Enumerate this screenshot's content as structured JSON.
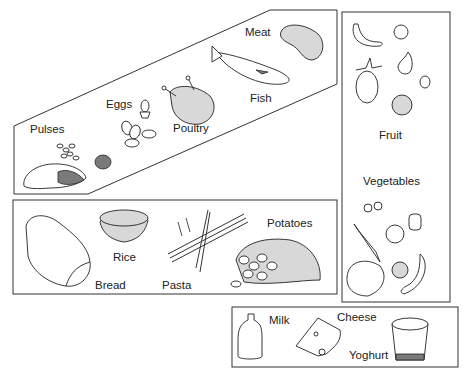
{
  "diagram": {
    "type": "food-groups",
    "groups": [
      {
        "id": "protein",
        "shape": "parallelogram",
        "items": [
          {
            "label": "Pulses"
          },
          {
            "label": "Eggs"
          },
          {
            "label": "Poultry"
          },
          {
            "label": "Fish"
          },
          {
            "label": "Meat"
          }
        ]
      },
      {
        "id": "fruit-veg",
        "shape": "tall-rectangle",
        "items": [
          {
            "label": "Fruit"
          },
          {
            "label": "Vegetables"
          }
        ]
      },
      {
        "id": "starch",
        "shape": "rectangle",
        "items": [
          {
            "label": "Rice"
          },
          {
            "label": "Potatoes"
          },
          {
            "label": "Bread"
          },
          {
            "label": "Pasta"
          }
        ]
      },
      {
        "id": "dairy",
        "shape": "rectangle",
        "items": [
          {
            "label": "Milk"
          },
          {
            "label": "Cheese"
          },
          {
            "label": "Yoghurt"
          }
        ]
      }
    ]
  },
  "colors": {
    "line": "#333333",
    "background": "#ffffff"
  }
}
